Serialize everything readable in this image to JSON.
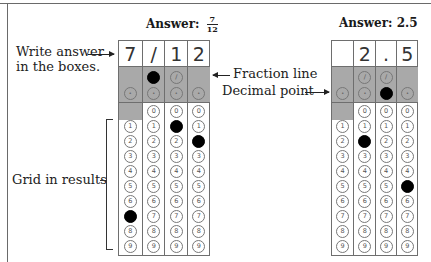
{
  "left_example": {
    "title_prefix": "Answer:",
    "fraction": {
      "numerator": "7",
      "denominator": "12"
    },
    "entries": [
      "7",
      "/",
      "1",
      "2"
    ],
    "filled": {
      "slash_col": 1,
      "decimal_col": null,
      "digits": [
        7,
        null,
        1,
        2
      ]
    }
  },
  "right_example": {
    "title": "Answer: 2.5",
    "entries": [
      "",
      "2",
      ".",
      "5"
    ],
    "filled": {
      "slash_col": null,
      "decimal_col": 2,
      "digits": [
        null,
        2,
        null,
        5
      ]
    }
  },
  "labels": {
    "write_answer_line1": "Write answer",
    "write_answer_line2": "in the boxes.",
    "fraction_line": "Fraction line",
    "decimal_point": "Decimal point",
    "grid_in_results": "Grid in results"
  },
  "grid_spec": {
    "columns": 4,
    "slash_columns": [
      1,
      2
    ],
    "zero_blank_column": 0,
    "digits": [
      "0",
      "1",
      "2",
      "3",
      "4",
      "5",
      "6",
      "7",
      "8",
      "9"
    ],
    "slash_symbol": "⊘",
    "decimal_symbol": "·"
  },
  "colors": {
    "band_gray": "#a9a9a9",
    "border": "#6e6e6e",
    "filled": "#000000"
  }
}
